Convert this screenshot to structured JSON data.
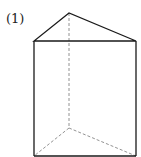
{
  "figure": {
    "label": "(1)",
    "shape": "triangular-prism",
    "stroke_color": "#1a1a1a",
    "hidden_stroke_color": "#777777",
    "vertices": {
      "top_apex": [
        69,
        13
      ],
      "top_left": [
        34,
        41
      ],
      "top_right": [
        136,
        41
      ],
      "bottom_back": [
        69,
        128
      ],
      "bottom_left": [
        34,
        156
      ],
      "bottom_right": [
        136,
        156
      ]
    }
  }
}
